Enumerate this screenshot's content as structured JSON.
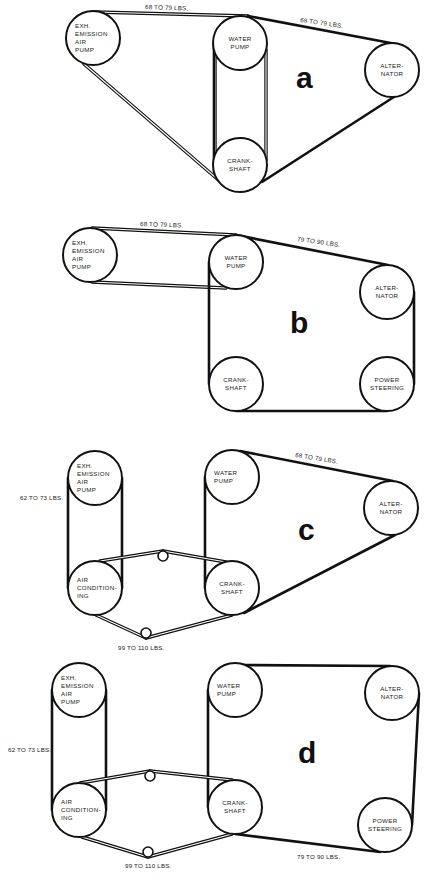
{
  "colors": {
    "ink": "#111111",
    "paper": "#ffffff"
  },
  "pulley_radius": 27,
  "idler_radius": 5,
  "diagrams": [
    {
      "id": "a",
      "letter": "a",
      "letter_pos": [
        296,
        88
      ],
      "pulleys": [
        {
          "key": "exh",
          "cx": 93,
          "cy": 38,
          "align": "left",
          "lines": [
            "EXH.",
            "EMISSION",
            "AIR",
            "PUMP"
          ]
        },
        {
          "key": "water",
          "cx": 240,
          "cy": 43,
          "align": "center",
          "lines": [
            "WATER",
            "PUMP"
          ]
        },
        {
          "key": "crank",
          "cx": 240,
          "cy": 165,
          "align": "center",
          "lines": [
            "CRANK-",
            "SHAFT"
          ]
        },
        {
          "key": "alt",
          "cx": 392,
          "cy": 70,
          "align": "center",
          "lines": [
            "ALTER-",
            "NATOR"
          ]
        }
      ],
      "idlers": [],
      "belts": [
        {
          "style": "double",
          "segments": [
            [
              [
                95,
                12
              ],
              [
                248,
                16
              ]
            ],
            [
              [
                84,
                64
              ],
              [
                222,
                183
              ]
            ],
            [
              [
                215,
                50
              ],
              [
                215,
                160
              ]
            ],
            [
              [
                266,
                50
              ],
              [
                266,
                160
              ]
            ]
          ]
        },
        {
          "style": "solid",
          "segments": [
            [
              [
                248,
                16
              ],
              [
                396,
                44
              ]
            ],
            [
              [
                262,
                182
              ],
              [
                397,
                95
              ]
            ],
            [
              [
                214,
                43
              ],
              [
                214,
                165
              ]
            ]
          ]
        }
      ],
      "tension_labels": [
        {
          "text": "68 TO 79 LBS.",
          "x": 145,
          "y": 9,
          "rotate": 2
        },
        {
          "text": "68 TO 79 LBS.",
          "x": 300,
          "y": 22,
          "rotate": 8
        }
      ]
    },
    {
      "id": "b",
      "letter": "b",
      "letter_pos": [
        290,
        333
      ],
      "pulleys": [
        {
          "key": "exh",
          "cx": 90,
          "cy": 255,
          "align": "left",
          "lines": [
            "EXH.",
            "EMISSION",
            "AIR",
            "PUMP"
          ]
        },
        {
          "key": "water",
          "cx": 236,
          "cy": 262,
          "align": "center",
          "lines": [
            "WATER",
            "PUMP"
          ]
        },
        {
          "key": "alt",
          "cx": 387,
          "cy": 292,
          "align": "center",
          "lines": [
            "ALTER-",
            "NATOR"
          ]
        },
        {
          "key": "crank",
          "cx": 236,
          "cy": 384,
          "align": "center",
          "lines": [
            "CRANK-",
            "SHAFT"
          ]
        },
        {
          "key": "power",
          "cx": 387,
          "cy": 384,
          "align": "center",
          "lines": [
            "POWER",
            "STEERING"
          ]
        }
      ],
      "idlers": [],
      "belts": [
        {
          "style": "double",
          "segments": [
            [
              [
                92,
                228
              ],
              [
                236,
                235
              ]
            ],
            [
              [
                92,
                282
              ],
              [
                226,
                288
              ]
            ]
          ]
        },
        {
          "style": "solid",
          "segments": [
            [
              [
                236,
                235
              ],
              [
                388,
                265
              ]
            ],
            [
              [
                414,
                292
              ],
              [
                414,
                384
              ]
            ],
            [
              [
                387,
                411
              ],
              [
                236,
                411
              ]
            ],
            [
              [
                209,
                384
              ],
              [
                209,
                262
              ]
            ]
          ]
        }
      ],
      "tension_labels": [
        {
          "text": "68 TO 79 LBS.",
          "x": 140,
          "y": 226,
          "rotate": 2
        },
        {
          "text": "79 TO 90 LBS.",
          "x": 297,
          "y": 241,
          "rotate": 8
        }
      ]
    },
    {
      "id": "c",
      "letter": "c",
      "letter_pos": [
        298,
        540
      ],
      "pulleys": [
        {
          "key": "exh",
          "cx": 95,
          "cy": 478,
          "align": "left",
          "lines": [
            "EXH.",
            "EMISSION",
            "AIR",
            "PUMP"
          ]
        },
        {
          "key": "ac",
          "cx": 95,
          "cy": 588,
          "align": "left",
          "lines": [
            "AIR",
            "CONDITION-",
            "ING"
          ]
        },
        {
          "key": "water",
          "cx": 232,
          "cy": 477,
          "align": "left",
          "lines": [
            "WATER",
            "PUMP"
          ]
        },
        {
          "key": "crank",
          "cx": 232,
          "cy": 588,
          "align": "center",
          "lines": [
            "CRANK-",
            "SHAFT"
          ]
        },
        {
          "key": "alt",
          "cx": 391,
          "cy": 508,
          "align": "center",
          "lines": [
            "ALTER-",
            "NATOR"
          ]
        }
      ],
      "idlers": [
        {
          "cx": 163,
          "cy": 556
        },
        {
          "cx": 146,
          "cy": 633
        }
      ],
      "belts": [
        {
          "style": "solid",
          "segments": [
            [
              [
                68,
                478
              ],
              [
                68,
                588
              ]
            ],
            [
              [
                122,
                478
              ],
              [
                122,
                588
              ]
            ],
            [
              [
                205,
                477
              ],
              [
                205,
                588
              ]
            ],
            [
              [
                240,
                451
              ],
              [
                393,
                481
              ]
            ],
            [
              [
                244,
                613
              ],
              [
                395,
                535
              ]
            ]
          ]
        },
        {
          "style": "double",
          "segments": [
            [
              [
                100,
                561
              ],
              [
                163,
                551
              ]
            ],
            [
              [
                163,
                551
              ],
              [
                226,
                562
              ]
            ],
            [
              [
                96,
                615
              ],
              [
                146,
                638
              ]
            ],
            [
              [
                146,
                638
              ],
              [
                232,
                615
              ]
            ]
          ]
        }
      ],
      "tension_labels": [
        {
          "text": "62 TO 73 LBS.",
          "x": 20,
          "y": 500,
          "rotate": 0
        },
        {
          "text": "68 TO 79 LBS.",
          "x": 295,
          "y": 457,
          "rotate": 9
        },
        {
          "text": "99 TO 110 LBS.",
          "x": 118,
          "y": 650,
          "rotate": 0
        }
      ]
    },
    {
      "id": "d",
      "letter": "d",
      "letter_pos": [
        298,
        763
      ],
      "pulleys": [
        {
          "key": "exh",
          "cx": 79,
          "cy": 690,
          "align": "left",
          "lines": [
            "EXH.",
            "EMISSION",
            "AIR",
            "PUMP"
          ]
        },
        {
          "key": "ac",
          "cx": 79,
          "cy": 810,
          "align": "left",
          "lines": [
            "AIR",
            "CONDITION-",
            "ING"
          ]
        },
        {
          "key": "water",
          "cx": 235,
          "cy": 690,
          "align": "left",
          "lines": [
            "WATER",
            "PUMP"
          ]
        },
        {
          "key": "crank",
          "cx": 235,
          "cy": 807,
          "align": "center",
          "lines": [
            "CRANK-",
            "SHAFT"
          ]
        },
        {
          "key": "alt",
          "cx": 392,
          "cy": 693,
          "align": "center",
          "lines": [
            "ALTER-",
            "NATOR"
          ]
        },
        {
          "key": "power",
          "cx": 385,
          "cy": 825,
          "align": "center",
          "lines": [
            "POWER",
            "STEERING"
          ]
        }
      ],
      "idlers": [
        {
          "cx": 150,
          "cy": 776
        },
        {
          "cx": 148,
          "cy": 852
        }
      ],
      "belts": [
        {
          "style": "solid",
          "segments": [
            [
              [
                52,
                690
              ],
              [
                52,
                810
              ]
            ],
            [
              [
                106,
                690
              ],
              [
                106,
                810
              ]
            ],
            [
              [
                208,
                690
              ],
              [
                208,
                807
              ]
            ],
            [
              [
                240,
                665
              ],
              [
                390,
                666
              ]
            ],
            [
              [
                419,
                693
              ],
              [
                412,
                825
              ]
            ],
            [
              [
                235,
                834
              ],
              [
                380,
                852
              ]
            ]
          ]
        },
        {
          "style": "double",
          "segments": [
            [
              [
                80,
                783
              ],
              [
                150,
                771
              ]
            ],
            [
              [
                150,
                771
              ],
              [
                232,
                780
              ]
            ],
            [
              [
                82,
                837
              ],
              [
                148,
                857
              ]
            ],
            [
              [
                148,
                857
              ],
              [
                232,
                834
              ]
            ]
          ]
        }
      ],
      "tension_labels": [
        {
          "text": "62 TO 73 LBS.",
          "x": 8,
          "y": 752,
          "rotate": 0
        },
        {
          "text": "99 TO 110 LBS.",
          "x": 125,
          "y": 868,
          "rotate": 0
        },
        {
          "text": "79 TO 90 LBS.",
          "x": 297,
          "y": 859,
          "rotate": 0
        }
      ]
    }
  ]
}
